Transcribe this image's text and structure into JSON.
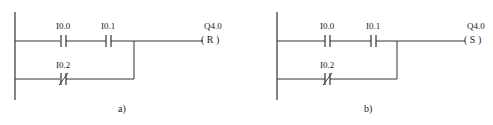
{
  "diagrams": [
    {
      "id": "a",
      "caption": "a)",
      "contacts": [
        {
          "label": "I0.0",
          "type": "normally-open"
        },
        {
          "label": "I0.1",
          "type": "normally-open"
        },
        {
          "label": "I0.2",
          "type": "normally-closed"
        }
      ],
      "coil": {
        "label": "Q4.0",
        "instruction": "R",
        "symbol": "( R )"
      }
    },
    {
      "id": "b",
      "caption": "b)",
      "contacts": [
        {
          "label": "I0.0",
          "type": "normally-open"
        },
        {
          "label": "I0.1",
          "type": "normally-open"
        },
        {
          "label": "I0.2",
          "type": "normally-closed"
        }
      ],
      "coil": {
        "label": "Q4.0",
        "instruction": "S",
        "symbol": "( S )"
      }
    }
  ],
  "colors": {
    "line": "#333333",
    "background": "#ffffff"
  }
}
